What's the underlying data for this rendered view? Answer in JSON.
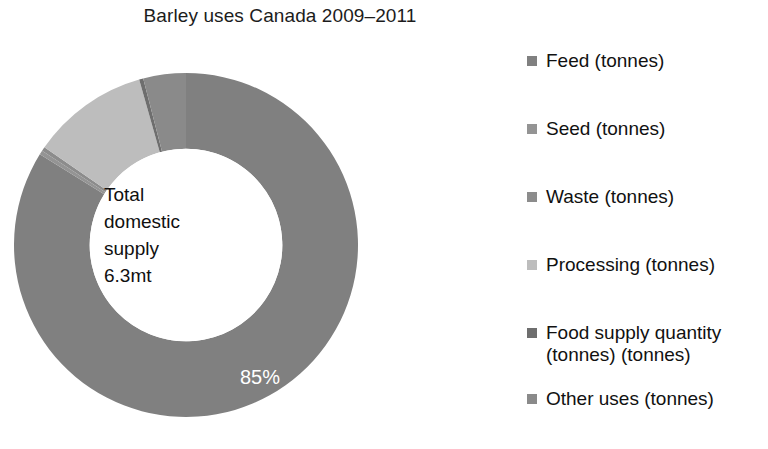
{
  "title": "Barley uses Canada 2009–2011",
  "center": {
    "line1": "Total",
    "line2": "domestic",
    "line3": "supply",
    "line4": "6.3mt"
  },
  "legend": {
    "items": [
      {
        "label": "Feed (tonnes)",
        "color": "#808080"
      },
      {
        "label": "Seed (tonnes)",
        "color": "#949494"
      },
      {
        "label": "Waste (tonnes)",
        "color": "#8c8c8c"
      },
      {
        "label": "Processing (tonnes)",
        "color": "#bdbdbd"
      },
      {
        "label": "Food supply quantity\n(tonnes) (tonnes)",
        "color": "#6e6e6e"
      },
      {
        "label": "Other uses (tonnes)",
        "color": "#8a8a8a"
      }
    ]
  },
  "chart_data": {
    "type": "pie",
    "variant": "donut",
    "title": "Barley uses Canada 2009–2011",
    "center_text": "Total domestic supply 6.3mt",
    "total_label": "Total domestic supply",
    "total_value": "6.3mt",
    "units": "tonnes",
    "start_angle_deg": 0,
    "direction": "clockwise",
    "inner_radius_ratio": 0.56,
    "grid": false,
    "legend_position": "right",
    "categories": [
      "Feed (tonnes)",
      "Seed (tonnes)",
      "Waste (tonnes)",
      "Processing (tonnes)",
      "Food supply quantity (tonnes) (tonnes)",
      "Other uses (tonnes)"
    ],
    "values": [
      85,
      0,
      0,
      11,
      0,
      4
    ],
    "data_labels": [
      "85%",
      "0%",
      "0%",
      "11%",
      "0%",
      "4%"
    ],
    "colors": [
      "#808080",
      "#949494",
      "#8c8c8c",
      "#bdbdbd",
      "#6e6e6e",
      "#8a8a8a"
    ],
    "slices": [
      {
        "name": "Feed (tonnes)",
        "value": 85,
        "label": "85%",
        "color": "#808080"
      },
      {
        "name": "Seed (tonnes)",
        "value": 0,
        "label": "0%",
        "color": "#949494"
      },
      {
        "name": "Waste (tonnes)",
        "value": 0,
        "label": "0%",
        "color": "#8c8c8c"
      },
      {
        "name": "Processing (tonnes)",
        "value": 11,
        "label": "11%",
        "color": "#bdbdbd"
      },
      {
        "name": "Food supply quantity (tonnes) (tonnes)",
        "value": 0,
        "label": "0%",
        "color": "#6e6e6e"
      },
      {
        "name": "Other uses (tonnes)",
        "value": 4,
        "label": "4%",
        "color": "#8a8a8a"
      }
    ]
  }
}
